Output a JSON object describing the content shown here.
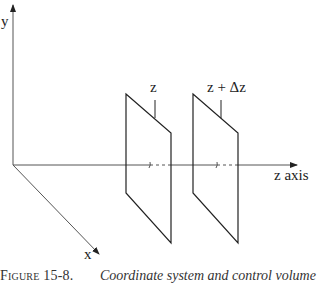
{
  "diagram": {
    "axes": {
      "y_label": "y",
      "x_label": "x",
      "z_label": "z axis"
    },
    "planes": [
      {
        "label": "z"
      },
      {
        "label": "z + Δz"
      }
    ],
    "colors": {
      "line": "#222222",
      "axis": "#555555"
    }
  },
  "caption": {
    "figure_number": "Figure 15-8.",
    "text": "Coordinate system and control volume for"
  }
}
